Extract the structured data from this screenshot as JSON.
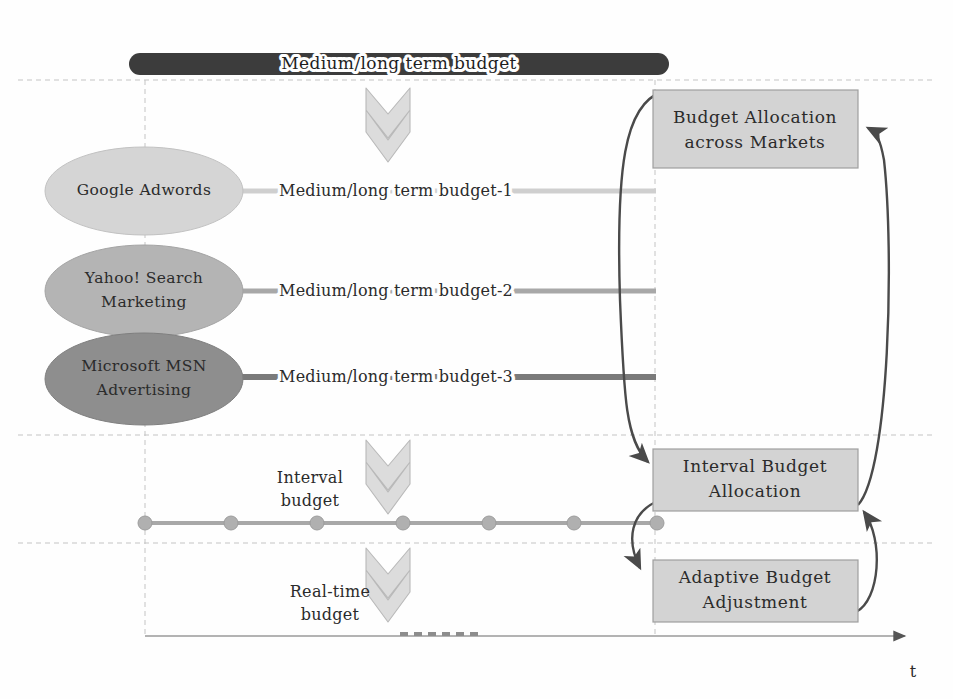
{
  "diagram": {
    "title_bar": {
      "label": "Medium/long term budget",
      "color": "#3c3c3c"
    },
    "channels": [
      {
        "id": "google-adwords",
        "label_line1": "Google Adwords",
        "label_line2": "",
        "fill": "#d5d5d5",
        "edge_label": "Medium/long term budget-1",
        "edge_color": "#cfcfcf"
      },
      {
        "id": "yahoo-search-marketing",
        "label_line1": "Yahoo! Search",
        "label_line2": "Marketing",
        "fill": "#b4b4b4",
        "edge_label": "Medium/long term budget-2",
        "edge_color": "#a8a8a8"
      },
      {
        "id": "microsoft-msn-advertising",
        "label_line1": "Microsoft MSN",
        "label_line2": "Advertising",
        "fill": "#8e8e8e",
        "edge_label": "Medium/long term budget-3",
        "edge_color": "#7a7a7a"
      }
    ],
    "process_boxes": [
      {
        "id": "budget-allocation-across-markets",
        "line1": "Budget Allocation",
        "line2": "across Markets",
        "fill": "#d3d3d3"
      },
      {
        "id": "interval-budget-allocation",
        "line1": "Interval Budget",
        "line2": "Allocation",
        "fill": "#d3d3d3"
      },
      {
        "id": "adaptive-budget-adjustment",
        "line1": "Adaptive Budget",
        "line2": "Adjustment",
        "fill": "#d3d3d3"
      }
    ],
    "phase_labels": [
      {
        "id": "interval-budget",
        "line1": "Interval",
        "line2": "budget"
      },
      {
        "id": "real-time-budget",
        "line1": "Real-time",
        "line2": "budget"
      }
    ],
    "timeline": {
      "axis_label": "t",
      "marker_count": 7,
      "marker_color": "#b0b0b0",
      "line_color": "#a8a8a8"
    },
    "arrows": {
      "chevron_fill": "#d9d9d9",
      "chevron_stroke": "#b8b8b8",
      "feedback_stroke": "#4a4a4a"
    },
    "guides": {
      "dashed_color": "#c0c0c0",
      "axis_color": "#9a9a9a"
    }
  }
}
